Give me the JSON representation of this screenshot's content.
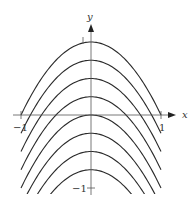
{
  "chart_data": {
    "type": "line",
    "title": "",
    "xlabel": "x",
    "ylabel": "y",
    "x_ticks": [
      {
        "value": -1,
        "label": "−1"
      },
      {
        "value": 1,
        "label": "1"
      }
    ],
    "y_ticks": [
      {
        "value": 1,
        "label": "1"
      },
      {
        "value": -1,
        "label": "−1"
      }
    ],
    "xlim": [
      -1,
      1
    ],
    "ylim": [
      -1.05,
      1
    ],
    "series": [
      {
        "name": "c=1",
        "c": 1
      },
      {
        "name": "c=0.75",
        "c": 0.75
      },
      {
        "name": "c=0.5",
        "c": 0.5
      },
      {
        "name": "c=0.25",
        "c": 0.25
      },
      {
        "name": "c=0",
        "c": 0
      },
      {
        "name": "c=-0.25",
        "c": -0.25
      },
      {
        "name": "c=-0.5",
        "c": -0.5
      },
      {
        "name": "c=-0.75",
        "c": -0.75
      }
    ],
    "grid": false,
    "legend": "none"
  },
  "axes": {
    "x_label": "x",
    "y_label": "y",
    "x_neg_tick": "−1",
    "x_pos_tick": "1",
    "y_pos_tick": "1",
    "y_neg_tick": "−1"
  },
  "colors": {
    "curve": "#2a2a2a",
    "axis": "#555555"
  }
}
